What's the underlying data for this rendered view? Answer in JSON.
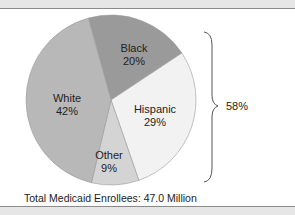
{
  "chart_data": {
    "type": "pie",
    "title": "",
    "caption": "Total Medicaid Enrollees: 47.0 Million",
    "slices": [
      {
        "label": "Black",
        "value": 20,
        "value_label": "20%",
        "color": "#9a9a9a"
      },
      {
        "label": "Hispanic",
        "value": 29,
        "value_label": "29%",
        "color": "#f2f2f2"
      },
      {
        "label": "Other",
        "value": 9,
        "value_label": "9%",
        "color": "#d4d4d4"
      },
      {
        "label": "White",
        "value": 42,
        "value_label": "42%",
        "color": "#b8b8b8"
      }
    ],
    "annotations": [
      {
        "type": "brace",
        "spans": [
          "Black",
          "Hispanic",
          "Other"
        ],
        "label": "58%"
      }
    ],
    "legend": "none",
    "units": "percent"
  },
  "labels": {
    "black_name": "Black",
    "black_pct": "20%",
    "hispanic_name": "Hispanic",
    "hispanic_pct": "29%",
    "other_name": "Other",
    "other_pct": "9%",
    "white_name": "White",
    "white_pct": "42%",
    "brace_total": "58%",
    "caption": "Total Medicaid Enrollees: 47.0 Million"
  }
}
